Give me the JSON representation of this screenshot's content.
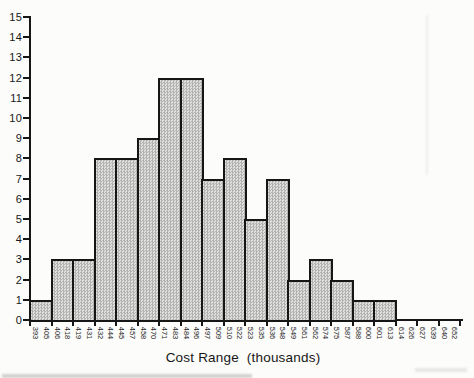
{
  "figure": {
    "background": "#fcfcfa",
    "ink": "#1a1a1a",
    "bar_fill_light": "#e0e0de",
    "bar_fill_dark": "#b3b3b1",
    "bar_border": "#161616"
  },
  "chart_data": {
    "type": "bar",
    "subtype": "histogram",
    "title": "",
    "xlabel": "Cost Range  (thousands)",
    "ylabel": "",
    "ylim": [
      0,
      15
    ],
    "y_ticks": [
      0,
      1,
      2,
      3,
      4,
      5,
      6,
      7,
      8,
      9,
      10,
      11,
      12,
      13,
      14,
      15
    ],
    "grid": false,
    "legend": false,
    "x_tick_label_rotation_deg": 90,
    "bins": [
      {
        "start": "393",
        "end": "405",
        "count": 1
      },
      {
        "start": "406",
        "end": "418",
        "count": 3
      },
      {
        "start": "419",
        "end": "431",
        "count": 3
      },
      {
        "start": "432",
        "end": "444",
        "count": 8
      },
      {
        "start": "445",
        "end": "457",
        "count": 8
      },
      {
        "start": "458",
        "end": "470",
        "count": 9
      },
      {
        "start": "471",
        "end": "483",
        "count": 12
      },
      {
        "start": "484",
        "end": "496",
        "count": 12
      },
      {
        "start": "497",
        "end": "509",
        "count": 7
      },
      {
        "start": "510",
        "end": "522",
        "count": 8
      },
      {
        "start": "523",
        "end": "535",
        "count": 5
      },
      {
        "start": "536",
        "end": "548",
        "count": 7
      },
      {
        "start": "549",
        "end": "561",
        "count": 2
      },
      {
        "start": "562",
        "end": "574",
        "count": 3
      },
      {
        "start": "575",
        "end": "587",
        "count": 2
      },
      {
        "start": "588",
        "end": "600",
        "count": 1
      },
      {
        "start": "601",
        "end": "613",
        "count": 1
      },
      {
        "start": "614",
        "end": "626",
        "count": 0
      },
      {
        "start": "627",
        "end": "639",
        "count": 0
      },
      {
        "start": "640",
        "end": "652",
        "count": 0
      }
    ]
  }
}
